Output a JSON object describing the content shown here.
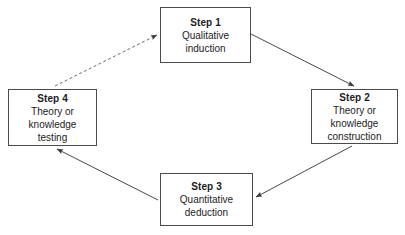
{
  "diagram": {
    "background_color": "#ffffff",
    "line_color": "#4a4a4a",
    "text_color": "#1c1c1c",
    "nodes": [
      {
        "id": "step-1",
        "title": "Step 1",
        "lines": [
          "Qualitative",
          "induction"
        ]
      },
      {
        "id": "step-2",
        "title": "Step 2",
        "lines": [
          "Theory or",
          "knowledge",
          "construction"
        ]
      },
      {
        "id": "step-3",
        "title": "Step 3",
        "lines": [
          "Quantitative",
          "deduction"
        ]
      },
      {
        "id": "step-4",
        "title": "Step 4",
        "lines": [
          "Theory or",
          "knowledge",
          "testing"
        ]
      }
    ],
    "connectors": [
      {
        "id": "step-1-to-step-2",
        "from": "step-1",
        "to": "step-2",
        "style": "solid",
        "arrowhead": true
      },
      {
        "id": "step-2-to-step-3",
        "from": "step-2",
        "to": "step-3",
        "style": "solid",
        "arrowhead": true
      },
      {
        "id": "step-3-to-step-4",
        "from": "step-3",
        "to": "step-4",
        "style": "solid",
        "arrowhead": true
      },
      {
        "id": "step-4-to-step-1",
        "from": "step-4",
        "to": "step-1",
        "style": "dashed",
        "arrowhead": true
      }
    ]
  }
}
